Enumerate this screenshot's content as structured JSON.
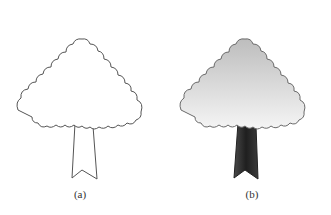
{
  "figure": {
    "panels": [
      {
        "id": "a",
        "label": "(a)",
        "style": "outline",
        "crown_fill": "#ffffff",
        "trunk_fill": "#ffffff",
        "stroke": "#555555"
      },
      {
        "id": "b",
        "label": "(b)",
        "style": "shaded",
        "crown_fill_top": "#bdbdbd",
        "crown_fill_bottom": "#f5f5f5",
        "trunk_fill": "#2a2a2a",
        "stroke": "#6a6a6a"
      }
    ]
  }
}
